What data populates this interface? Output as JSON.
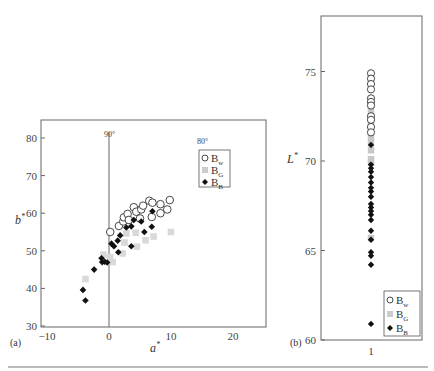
{
  "chart_data": [
    {
      "panel": "(a)",
      "type": "scatter",
      "title": "",
      "xlabel": "a*",
      "ylabel": "b*",
      "xlim": [
        -11,
        25
      ],
      "ylim": [
        30,
        85
      ],
      "xticks": [
        -10,
        0,
        10,
        20
      ],
      "yticks": [
        30,
        40,
        50,
        60,
        70,
        80
      ],
      "grid": false,
      "legend_position": "upper right",
      "annotations": [
        {
          "text": "90°",
          "x": 0,
          "y": 81
        },
        {
          "text": "80°",
          "x": 14.5,
          "y": 79
        }
      ],
      "reference_line": {
        "x": 0,
        "label": "90°"
      },
      "series": [
        {
          "name": "Bw",
          "marker": "open-circle",
          "color": "#333333",
          "points": [
            [
              0.2,
              55
            ],
            [
              1.6,
              56.6
            ],
            [
              2.3,
              57.8
            ],
            [
              2.4,
              58.9
            ],
            [
              3.0,
              59.8
            ],
            [
              3.2,
              58.2
            ],
            [
              4.0,
              61.6
            ],
            [
              4.4,
              60.4
            ],
            [
              5.2,
              61.0
            ],
            [
              5.5,
              62.0
            ],
            [
              5.0,
              58.6
            ],
            [
              6.5,
              63.3
            ],
            [
              7.0,
              62.8
            ],
            [
              6.9,
              59.0
            ],
            [
              8.3,
              62.4
            ],
            [
              8.3,
              60.0
            ],
            [
              9.4,
              61.0
            ],
            [
              9.8,
              63.5
            ]
          ]
        },
        {
          "name": "BG",
          "marker": "square",
          "color": "#d9d9d9",
          "points": [
            [
              -3.8,
              42.5
            ],
            [
              -0.9,
              49.0
            ],
            [
              0.2,
              48.3
            ],
            [
              0.6,
              47.0
            ],
            [
              2.2,
              49.3
            ],
            [
              2.8,
              54.6
            ],
            [
              4.3,
              54.8
            ],
            [
              4.5,
              51.1
            ],
            [
              5.9,
              52.8
            ],
            [
              7.2,
              53.8
            ],
            [
              10.0,
              55.0
            ],
            [
              2.5,
              52.2
            ]
          ]
        },
        {
          "name": "BB",
          "marker": "filled-diamond",
          "color": "#111111",
          "points": [
            [
              -4.2,
              39.6
            ],
            [
              -3.8,
              36.8
            ],
            [
              -2.4,
              45.0
            ],
            [
              -1.2,
              48.0
            ],
            [
              -1.1,
              47.0
            ],
            [
              -0.7,
              47.1
            ],
            [
              -0.3,
              46.9
            ],
            [
              0.4,
              51.9
            ],
            [
              0.8,
              51.2
            ],
            [
              1.4,
              52.7
            ],
            [
              1.5,
              49.6
            ],
            [
              1.8,
              54.1
            ],
            [
              2.8,
              56.2
            ],
            [
              3.6,
              56.5
            ],
            [
              3.6,
              51.2
            ],
            [
              4.0,
              58.2
            ],
            [
              5.2,
              57.8
            ],
            [
              5.7,
              55.0
            ],
            [
              6.9,
              56.4
            ],
            [
              7.0,
              60.5
            ]
          ]
        }
      ]
    },
    {
      "panel": "(b)",
      "type": "scatter",
      "title": "",
      "xlabel": "",
      "ylabel": "L*",
      "xlim": [
        0,
        2
      ],
      "ylim": [
        60,
        78
      ],
      "xticks": [
        1
      ],
      "yticks": [
        60,
        65,
        70,
        75
      ],
      "grid": false,
      "legend_position": "lower right",
      "series": [
        {
          "name": "Bw",
          "marker": "open-circle",
          "color": "#333333",
          "x": 1,
          "values": [
            74.9,
            74.6,
            74.3,
            74.0,
            73.5,
            73.3,
            73.1,
            72.5,
            72.3,
            71.9,
            71.6
          ]
        },
        {
          "name": "BG",
          "marker": "square",
          "color": "#c8c8c8",
          "x": 1,
          "values": [
            73.0,
            72.7,
            72.1,
            71.3,
            71.0,
            70.6,
            70.1,
            69.9,
            65.7
          ]
        },
        {
          "name": "BB",
          "marker": "filled-diamond",
          "color": "#111111",
          "x": 1,
          "values": [
            70.9,
            69.8,
            69.6,
            69.4,
            69.1,
            68.8,
            68.5,
            68.3,
            68.0,
            67.6,
            67.4,
            67.2,
            67.0,
            66.7,
            66.1,
            65.6,
            64.9,
            64.7,
            64.2,
            60.9
          ]
        }
      ]
    }
  ],
  "labels": {
    "panel_a": "(a)",
    "panel_b": "(b)",
    "a_xlabel": "a",
    "a_ylabel": "b",
    "b_ylabel": "L",
    "star": "*",
    "ann_90": "90°",
    "ann_80": "80°",
    "legend": [
      {
        "main": "B",
        "sub": "w"
      },
      {
        "main": "B",
        "sub": "G"
      },
      {
        "main": "B",
        "sub": "B"
      }
    ]
  }
}
